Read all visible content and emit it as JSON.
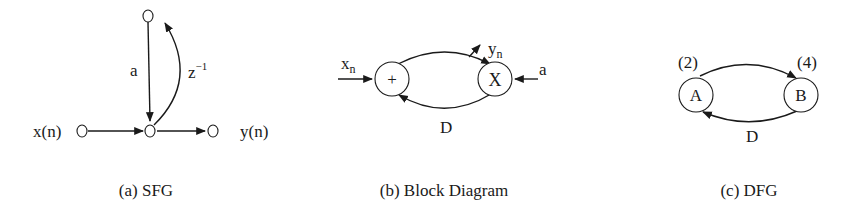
{
  "figures": [
    {
      "id": "sfg",
      "caption": "(a) SFG",
      "labels": {
        "input": "x(n)",
        "output": "y(n)",
        "gain": "a",
        "delay": "z",
        "delay_exp": "−1"
      }
    },
    {
      "id": "block",
      "caption": "(b) Block Diagram",
      "labels": {
        "input": "x",
        "input_sub": "n",
        "output": "y",
        "output_sub": "n",
        "coef": "a",
        "adder": "+",
        "multiplier": "X",
        "delay": "D"
      }
    },
    {
      "id": "dfg",
      "caption": "(c) DFG",
      "labels": {
        "node_a": "A",
        "node_b": "B",
        "time_a": "(2)",
        "time_b": "(4)",
        "delay": "D"
      }
    }
  ]
}
